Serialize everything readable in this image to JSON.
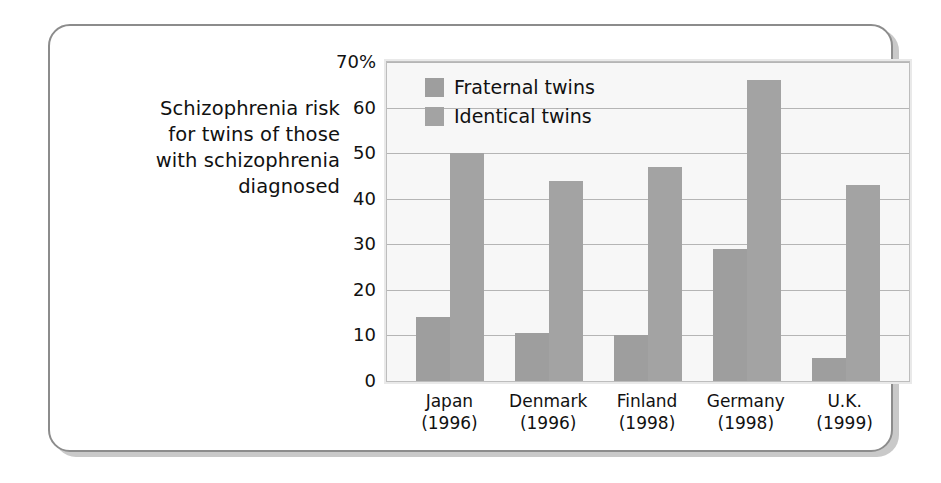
{
  "figure": {
    "caption": "Schizophrenia risk for twins of those with schizophrenia diagnosed",
    "caption_lines": [
      "Schizophrenia risk",
      "for twins of those",
      "with schizophrenia",
      "diagnosed"
    ]
  },
  "colors": {
    "fraternal_bar": "#9e9e9e",
    "identical_bar": "#a3a3a3",
    "plot_background": "#f7f7f7",
    "plot_border": "#bdbdbd",
    "gridline": "#b5b5b5",
    "frame_border": "#8c8c8c",
    "frame_shadow": "#c9c9c9",
    "page_background": "#ffffff",
    "text": "#111111"
  },
  "chart_data": {
    "type": "bar",
    "title": "Schizophrenia risk for twins of those with schizophrenia diagnosed",
    "xlabel": "",
    "ylabel": "",
    "ylim": [
      0,
      70
    ],
    "yticks": [
      0,
      10,
      20,
      30,
      40,
      50,
      60,
      70
    ],
    "ytick_labels": [
      "0",
      "10",
      "20",
      "30",
      "40",
      "50",
      "60",
      "70%"
    ],
    "grid": true,
    "legend_position": "inside-top-left",
    "units": "percent",
    "categories": [
      "Japan",
      "Denmark",
      "Finland",
      "Germany",
      "U.K."
    ],
    "category_years": [
      "(1996)",
      "(1996)",
      "(1998)",
      "(1998)",
      "(1999)"
    ],
    "category_labels": [
      [
        "Japan",
        "(1996)"
      ],
      [
        "Denmark",
        "(1996)"
      ],
      [
        "Finland",
        "(1998)"
      ],
      [
        "Germany",
        "(1998)"
      ],
      [
        "U.K.",
        "(1999)"
      ]
    ],
    "series": [
      {
        "name": "Fraternal twins",
        "values": [
          14,
          10.5,
          10,
          29,
          5
        ]
      },
      {
        "name": "Identical twins",
        "values": [
          50,
          44,
          47,
          66,
          43
        ]
      }
    ]
  }
}
